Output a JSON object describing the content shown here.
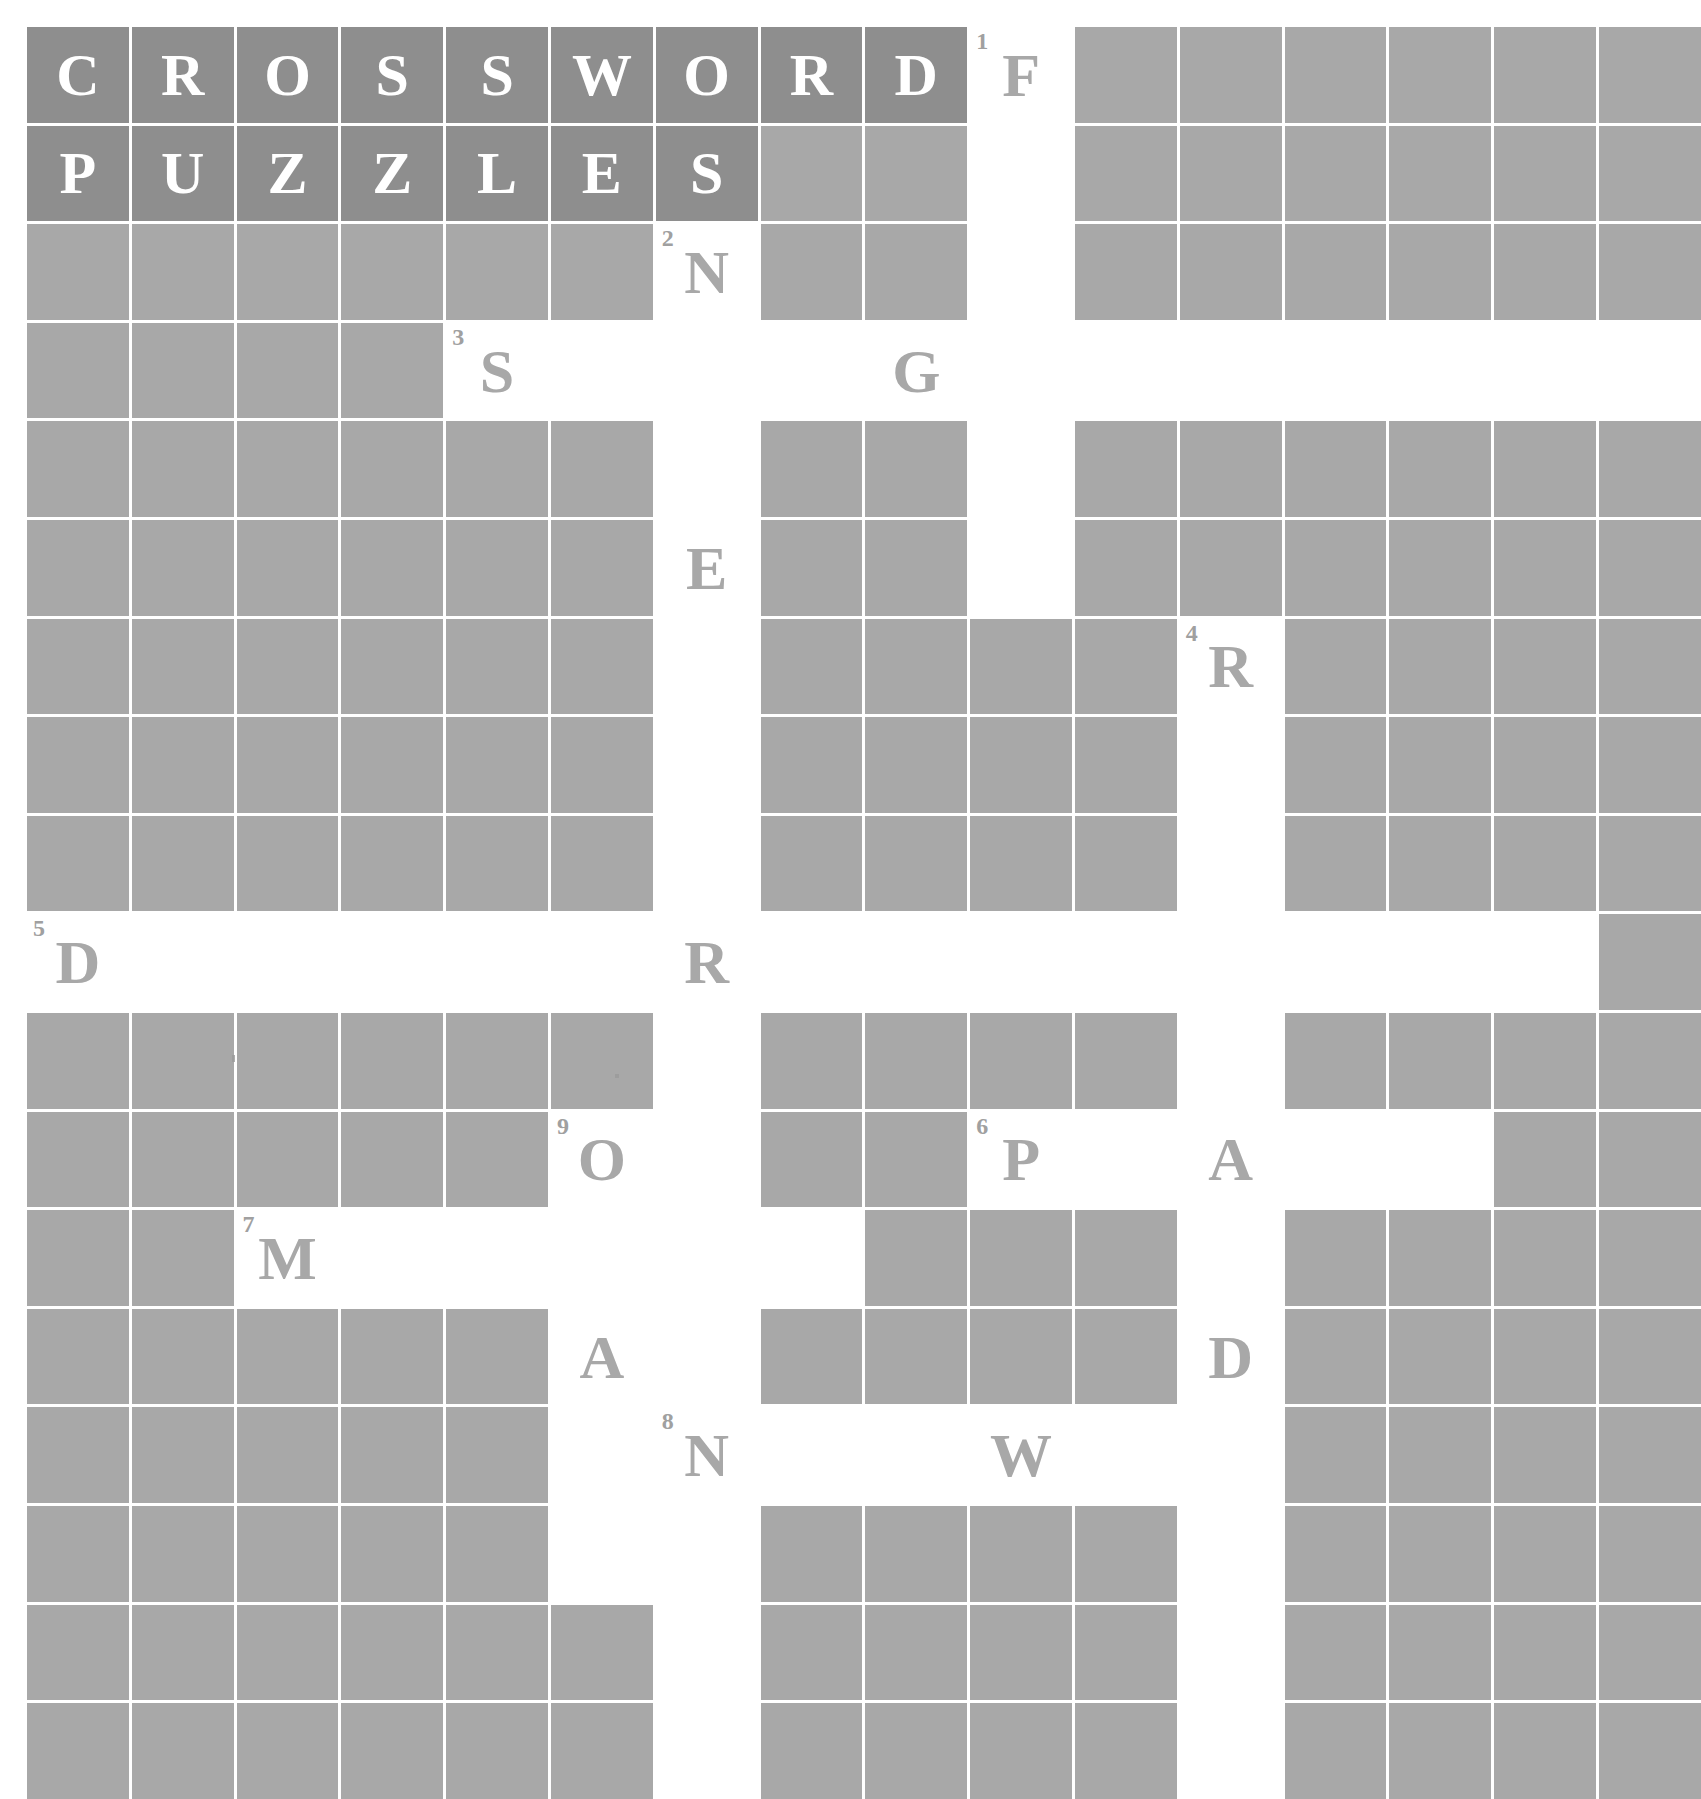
{
  "title": {
    "line1": "CROSSWORD",
    "line2": "PUZZLES",
    "line1_letters": [
      "C",
      "R",
      "O",
      "S",
      "S",
      "W",
      "O",
      "R",
      "D"
    ],
    "line2_letters": [
      "P",
      "U",
      "Z",
      "Z",
      "L",
      "E",
      "S"
    ],
    "background_color": "#8e8e8e",
    "text_color": "#ffffff"
  },
  "grid": {
    "columns": 16,
    "rows": 18,
    "cell_background_blocked": "#a8a8a8",
    "cell_background_open": "#ffffff",
    "gridline_color": "#ffffff",
    "letter_color": "#a8a8a8",
    "clue_number_color": "#a0a0a0"
  },
  "clue_numbers": [
    {
      "number": "1",
      "row": 0,
      "col": 9
    },
    {
      "number": "2",
      "row": 2,
      "col": 6
    },
    {
      "number": "3",
      "row": 3,
      "col": 4
    },
    {
      "number": "4",
      "row": 6,
      "col": 11
    },
    {
      "number": "5",
      "row": 9,
      "col": 0
    },
    {
      "number": "6",
      "row": 11,
      "col": 9
    },
    {
      "number": "7",
      "row": 12,
      "col": 2
    },
    {
      "number": "8",
      "row": 14,
      "col": 6
    },
    {
      "number": "9",
      "row": 11,
      "col": 5
    }
  ],
  "letters": [
    {
      "char": "F",
      "row": 0,
      "col": 9
    },
    {
      "char": "N",
      "row": 2,
      "col": 6
    },
    {
      "char": "S",
      "row": 3,
      "col": 4
    },
    {
      "char": "G",
      "row": 3,
      "col": 8
    },
    {
      "char": "E",
      "row": 5,
      "col": 6
    },
    {
      "char": "R",
      "row": 6,
      "col": 11
    },
    {
      "char": "D",
      "row": 9,
      "col": 0
    },
    {
      "char": "R",
      "row": 9,
      "col": 6
    },
    {
      "char": "O",
      "row": 11,
      "col": 5
    },
    {
      "char": "P",
      "row": 11,
      "col": 9
    },
    {
      "char": "A",
      "row": 11,
      "col": 11
    },
    {
      "char": "M",
      "row": 12,
      "col": 2
    },
    {
      "char": "A",
      "row": 13,
      "col": 5
    },
    {
      "char": "D",
      "row": 13,
      "col": 11
    },
    {
      "char": "N",
      "row": 14,
      "col": 6
    },
    {
      "char": "W",
      "row": 14,
      "col": 9
    }
  ],
  "open_cells": [
    [
      0,
      9
    ],
    [
      1,
      9
    ],
    [
      2,
      6
    ],
    [
      2,
      9
    ],
    [
      3,
      4
    ],
    [
      3,
      5
    ],
    [
      3,
      6
    ],
    [
      3,
      7
    ],
    [
      3,
      8
    ],
    [
      3,
      9
    ],
    [
      3,
      10
    ],
    [
      3,
      11
    ],
    [
      3,
      12
    ],
    [
      3,
      13
    ],
    [
      3,
      14
    ],
    [
      3,
      15
    ],
    [
      4,
      6
    ],
    [
      4,
      9
    ],
    [
      5,
      6
    ],
    [
      5,
      9
    ],
    [
      6,
      6
    ],
    [
      6,
      11
    ],
    [
      7,
      6
    ],
    [
      7,
      11
    ],
    [
      8,
      6
    ],
    [
      8,
      11
    ],
    [
      9,
      0
    ],
    [
      9,
      1
    ],
    [
      9,
      2
    ],
    [
      9,
      3
    ],
    [
      9,
      4
    ],
    [
      9,
      5
    ],
    [
      9,
      6
    ],
    [
      9,
      7
    ],
    [
      9,
      8
    ],
    [
      9,
      9
    ],
    [
      9,
      10
    ],
    [
      9,
      11
    ],
    [
      9,
      12
    ],
    [
      9,
      13
    ],
    [
      9,
      14
    ],
    [
      10,
      6
    ],
    [
      10,
      11
    ],
    [
      11,
      5
    ],
    [
      11,
      6
    ],
    [
      11,
      9
    ],
    [
      11,
      10
    ],
    [
      11,
      11
    ],
    [
      11,
      12
    ],
    [
      11,
      13
    ],
    [
      12,
      2
    ],
    [
      12,
      3
    ],
    [
      12,
      4
    ],
    [
      12,
      5
    ],
    [
      12,
      6
    ],
    [
      12,
      7
    ],
    [
      12,
      11
    ],
    [
      13,
      5
    ],
    [
      13,
      6
    ],
    [
      13,
      11
    ],
    [
      14,
      5
    ],
    [
      14,
      6
    ],
    [
      14,
      7
    ],
    [
      14,
      8
    ],
    [
      14,
      9
    ],
    [
      14,
      10
    ],
    [
      14,
      11
    ],
    [
      15,
      5
    ],
    [
      15,
      6
    ],
    [
      15,
      11
    ],
    [
      16,
      6
    ],
    [
      16,
      11
    ],
    [
      17,
      6
    ],
    [
      17,
      11
    ]
  ],
  "title_cells": [
    [
      0,
      0
    ],
    [
      0,
      1
    ],
    [
      0,
      2
    ],
    [
      0,
      3
    ],
    [
      0,
      4
    ],
    [
      0,
      5
    ],
    [
      0,
      6
    ],
    [
      0,
      7
    ],
    [
      0,
      8
    ],
    [
      1,
      0
    ],
    [
      1,
      1
    ],
    [
      1,
      2
    ],
    [
      1,
      3
    ],
    [
      1,
      4
    ],
    [
      1,
      5
    ],
    [
      1,
      6
    ]
  ]
}
